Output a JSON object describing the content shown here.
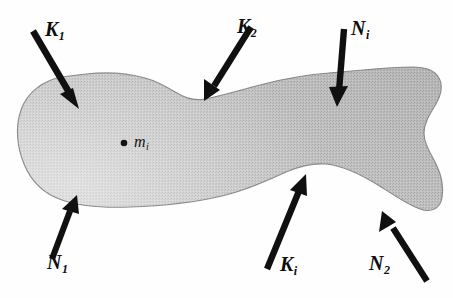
{
  "figure": {
    "kind": "free-body-diagram",
    "background_color": "#fefefe",
    "body": {
      "name": "rigid-body-blob",
      "fill_color": "#b7b7b7",
      "highlight_color": "#d2d2d2",
      "outline_color": "#6e6e6e",
      "texture": "halftone-stipple"
    },
    "mass_point": {
      "label_text": "m",
      "subscript": "i",
      "dot_color": "#141414"
    },
    "arrow_color": "#101010",
    "forces": [
      {
        "id": "K1",
        "label_text": "K",
        "subscript": "1",
        "direction": "down-right",
        "tail": [
          33,
          31
        ],
        "tip": [
          79,
          109
        ]
      },
      {
        "id": "K2",
        "label_text": "K",
        "subscript": "2",
        "direction": "down-left",
        "tail": [
          251,
          27
        ],
        "tip": [
          204,
          101
        ]
      },
      {
        "id": "Ni",
        "label_text": "N",
        "subscript": "i",
        "direction": "down",
        "tail": [
          344,
          29
        ],
        "tip": [
          337,
          107
        ]
      },
      {
        "id": "N1",
        "label_text": "N",
        "subscript": "1",
        "direction": "up-right",
        "tail": [
          52,
          259
        ],
        "tip": [
          77,
          195
        ]
      },
      {
        "id": "Ki",
        "label_text": "K",
        "subscript": "i",
        "direction": "up-right",
        "tail": [
          267,
          269
        ],
        "tip": [
          306,
          174
        ]
      },
      {
        "id": "N2",
        "label_text": "N",
        "subscript": "2",
        "direction": "up-left",
        "tail": [
          427,
          281
        ],
        "tip": [
          382,
          211
        ]
      }
    ]
  }
}
